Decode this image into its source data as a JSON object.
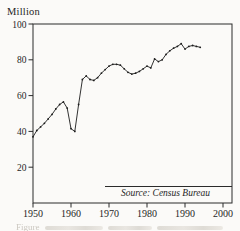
{
  "chart_data": {
    "type": "line",
    "title": "",
    "xlabel": "",
    "ylabel": "Million",
    "unit_label": "Million",
    "source_note": "Source: Census Bureau",
    "caption_fragment": "Figure",
    "xlim": [
      1950,
      2000
    ],
    "ylim": [
      0,
      100
    ],
    "x_ticks": [
      1950,
      1960,
      1970,
      1980,
      1990,
      2000
    ],
    "y_ticks": [
      20,
      40,
      60,
      80,
      100
    ],
    "grid": false,
    "legend": false,
    "marker": "dot",
    "line_color": "#1c1c1c",
    "axis_color": "#2b2b2b",
    "text_color": "#1f1f1f",
    "background_color": "#fbfaf8",
    "x": [
      1950,
      1951,
      1952,
      1953,
      1954,
      1955,
      1956,
      1957,
      1958,
      1959,
      1960,
      1961,
      1962,
      1963,
      1964,
      1965,
      1966,
      1967,
      1968,
      1969,
      1970,
      1971,
      1972,
      1973,
      1974,
      1975,
      1976,
      1977,
      1978,
      1979,
      1980,
      1981,
      1982,
      1983,
      1984,
      1985,
      1986,
      1987,
      1988,
      1989,
      1990,
      1991,
      1992,
      1993,
      1994
    ],
    "values": [
      37,
      40.5,
      42.5,
      44.5,
      47,
      49.5,
      52.5,
      55,
      56.5,
      53,
      41.5,
      40,
      55,
      69,
      71,
      69,
      68.5,
      70,
      72.5,
      74.5,
      76.5,
      77.5,
      77.5,
      77,
      75,
      73,
      72,
      72.5,
      73.5,
      75,
      76.5,
      75.5,
      80.5,
      79,
      80,
      83,
      85,
      86.5,
      87.5,
      89,
      86,
      87.5,
      88,
      87.5,
      87
    ]
  }
}
